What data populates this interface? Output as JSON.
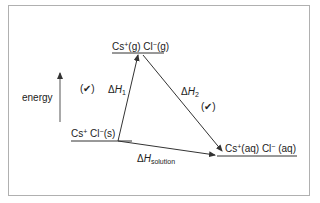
{
  "diagram": {
    "type": "energy-cycle",
    "axis_label": "energy",
    "levels": {
      "top": {
        "text_pre": "Cs",
        "sup1": "+",
        "mid": "(g) Cl",
        "sup2": "−",
        "post": "(g)"
      },
      "left": {
        "text_pre": "Cs",
        "sup1": "+",
        "mid": " Cl",
        "sup2": "−",
        "post": "(s)"
      },
      "right": {
        "text_pre": "Cs",
        "sup1": "+",
        "mid": "(aq) Cl",
        "sup2": "−",
        "post": " (aq)"
      }
    },
    "arrows": {
      "dh1": {
        "delta": "Δ",
        "symbol": "H",
        "sub": "1"
      },
      "dh2": {
        "delta": "Δ",
        "symbol": "H",
        "sub": "2"
      },
      "dhsol": {
        "delta": "Δ",
        "symbol": "H",
        "sub": "solution"
      }
    },
    "marks": [
      "(✔)",
      "(✔)"
    ],
    "colors": {
      "line": "#333333",
      "frame": "#b0b0b0",
      "axis": "#555555"
    }
  }
}
